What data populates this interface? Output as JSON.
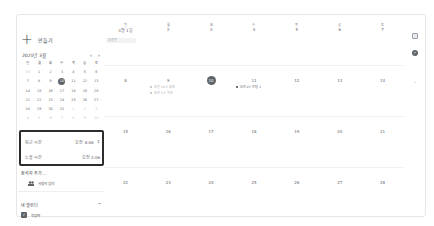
{
  "sidebar": {
    "create_label": "만들기",
    "create_icon": "plus-icon",
    "mini_calendar": {
      "title": "2021년 3월",
      "prev_icon": "‹",
      "next_icon": "›",
      "weekdays": [
        "일",
        "월",
        "화",
        "수",
        "목",
        "금",
        "토"
      ],
      "days": [
        {
          "d": "28",
          "dim": true
        },
        {
          "d": "1"
        },
        {
          "d": "2"
        },
        {
          "d": "3"
        },
        {
          "d": "4"
        },
        {
          "d": "5"
        },
        {
          "d": "6"
        },
        {
          "d": "7"
        },
        {
          "d": "8"
        },
        {
          "d": "9"
        },
        {
          "d": "10",
          "today": true
        },
        {
          "d": "11"
        },
        {
          "d": "12"
        },
        {
          "d": "13"
        },
        {
          "d": "14"
        },
        {
          "d": "15"
        },
        {
          "d": "16"
        },
        {
          "d": "17"
        },
        {
          "d": "18"
        },
        {
          "d": "19"
        },
        {
          "d": "20"
        },
        {
          "d": "21"
        },
        {
          "d": "22"
        },
        {
          "d": "23"
        },
        {
          "d": "24"
        },
        {
          "d": "25"
        },
        {
          "d": "26"
        },
        {
          "d": "27"
        },
        {
          "d": "28"
        },
        {
          "d": "29"
        },
        {
          "d": "30"
        },
        {
          "d": "31"
        },
        {
          "d": "1",
          "dim": true
        },
        {
          "d": "2",
          "dim": true
        },
        {
          "d": "3",
          "dim": true
        },
        {
          "d": "4",
          "dim": true
        },
        {
          "d": "5",
          "dim": true
        },
        {
          "d": "6",
          "dim": true
        },
        {
          "d": "7",
          "dim": true
        },
        {
          "d": "8",
          "dim": true
        },
        {
          "d": "9",
          "dim": true
        },
        {
          "d": "10",
          "dim": true
        }
      ]
    },
    "time_box": {
      "row1_label": "퇴근 시간",
      "row1_value": "오전 8:06",
      "row1_icon": "↕",
      "row2_label": "노을 시간",
      "row2_value": "오전 2:06"
    },
    "add_attendees": "참석자 추가...",
    "search_people": "사람의 검색",
    "search_people_icon": "people-icon",
    "my_calendars": "내 캘린더",
    "my_calendars_toggle": "^",
    "calendar_item": "작성자"
  },
  "main": {
    "weekdays": [
      "일",
      "월",
      "화",
      "수",
      "목",
      "금",
      "토"
    ],
    "weeks": [
      [
        "3월 1일",
        "2",
        "3",
        "4",
        "5",
        "6",
        "7"
      ],
      [
        "8",
        "9",
        "10",
        "11",
        "12",
        "13",
        "14"
      ],
      [
        "15",
        "16",
        "17",
        "18",
        "19",
        "20",
        "21"
      ],
      [
        "22",
        "23",
        "24",
        "25",
        "26",
        "27",
        "28"
      ]
    ],
    "today": "10",
    "chip_first_week": "공휴일",
    "events": {
      "day9": [
        "오전 10시 회의",
        "오후 3시 약속"
      ],
      "day11": [
        "오후 2시 미팅 1"
      ]
    }
  },
  "right_panel": {
    "icon1": "square-icon",
    "icon2": "check-circle-icon",
    "icon3": "dot-icon"
  }
}
